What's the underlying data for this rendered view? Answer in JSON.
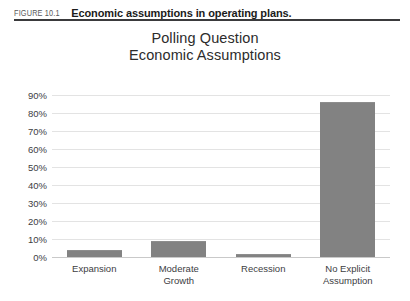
{
  "figure": {
    "number": "FIGURE 10.1",
    "caption": "Economic assumptions in operating plans."
  },
  "chart_data": {
    "type": "bar",
    "title": "Polling Question\nEconomic Assumptions",
    "title_lines": [
      "Polling Question",
      "Economic Assumptions"
    ],
    "categories": [
      "Expansion",
      "Moderate Growth",
      "Recession",
      "No Explicit Assumption"
    ],
    "category_lines": [
      [
        "Expansion"
      ],
      [
        "Moderate",
        "Growth"
      ],
      [
        "Recession"
      ],
      [
        "No Explicit",
        "Assumption"
      ]
    ],
    "values": [
      4,
      9,
      1.5,
      86
    ],
    "xlabel": "",
    "ylabel": "",
    "ylim": [
      0,
      90
    ],
    "ytick_values": [
      0,
      10,
      20,
      30,
      40,
      50,
      60,
      70,
      80,
      90
    ],
    "ytick_labels": [
      "0%",
      "10%",
      "20%",
      "30%",
      "40%",
      "50%",
      "60%",
      "70%",
      "80%",
      "90%"
    ],
    "grid": true,
    "legend": false,
    "bar_color": "#828282",
    "gridline_color": "#e3e3e3",
    "axis_color": "#c9c9c9",
    "background": "#ffffff"
  }
}
